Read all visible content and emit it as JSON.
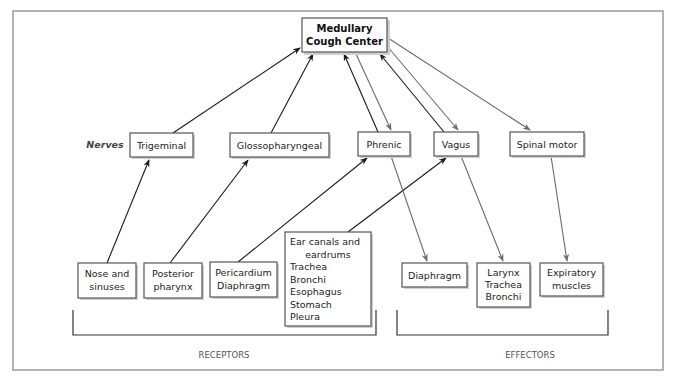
{
  "center": {
    "line1": "Medullary",
    "line2": "Cough Center"
  },
  "nerves_label": "Nerves",
  "nerves": [
    {
      "id": "trigeminal",
      "label": "Trigeminal"
    },
    {
      "id": "glossopharyngeal",
      "label": "Glossopharyngeal"
    },
    {
      "id": "phrenic",
      "label": "Phrenic"
    },
    {
      "id": "vagus",
      "label": "Vagus"
    },
    {
      "id": "spinal-motor",
      "label": "Spinal motor"
    }
  ],
  "receptors": [
    {
      "id": "nose",
      "lines": [
        "Nose and",
        "sinuses"
      ]
    },
    {
      "id": "pharynx",
      "lines": [
        "Posterior",
        "pharynx"
      ]
    },
    {
      "id": "pericardium",
      "lines": [
        "Pericardium",
        "Diaphragm"
      ]
    },
    {
      "id": "ear",
      "lines": [
        "Ear canals and",
        "eardrums",
        "Trachea",
        "Bronchi",
        "Esophagus",
        "Stomach",
        "Pleura"
      ]
    }
  ],
  "effectors": [
    {
      "id": "diaphragm",
      "lines": [
        "Diaphragm"
      ]
    },
    {
      "id": "larynx",
      "lines": [
        "Larynx",
        "Trachea",
        "Bronchi"
      ]
    },
    {
      "id": "expiratory",
      "lines": [
        "Expiratory",
        "muscles"
      ]
    }
  ],
  "group_labels": {
    "receptors": "RECEPTORS",
    "effectors": "EFFECTORS"
  },
  "connections": {
    "afferent": [
      [
        "Nose and sinuses",
        "Trigeminal"
      ],
      [
        "Posterior pharynx",
        "Glossopharyngeal"
      ],
      [
        "Pericardium Diaphragm",
        "Phrenic"
      ],
      [
        "Ear canals ... Pleura",
        "Vagus"
      ],
      [
        "Trigeminal",
        "Medullary Cough Center"
      ],
      [
        "Glossopharyngeal",
        "Medullary Cough Center"
      ],
      [
        "Phrenic",
        "Medullary Cough Center"
      ],
      [
        "Vagus",
        "Medullary Cough Center"
      ]
    ],
    "efferent": [
      [
        "Medullary Cough Center",
        "Phrenic"
      ],
      [
        "Medullary Cough Center",
        "Vagus"
      ],
      [
        "Medullary Cough Center",
        "Spinal motor"
      ],
      [
        "Phrenic",
        "Diaphragm"
      ],
      [
        "Vagus",
        "Larynx Trachea Bronchi"
      ],
      [
        "Spinal motor",
        "Expiratory muscles"
      ]
    ]
  }
}
